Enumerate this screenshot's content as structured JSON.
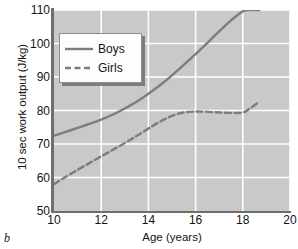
{
  "figure": {
    "panel_label": "b"
  },
  "legend": {
    "position": "top-left-inside",
    "entries": [
      {
        "label": "Boys",
        "style": "solid"
      },
      {
        "label": "Girls",
        "style": "dashed"
      }
    ]
  },
  "colors": {
    "plot_background": "#c9c9c9",
    "gridline": "#ffffff",
    "series_line": "#7d7d7d",
    "axis": "#6e6e6e",
    "text": "#141414",
    "legend_background": "#fdfdfd"
  },
  "chart_data": {
    "type": "line",
    "title": "",
    "xlabel": "Age (years)",
    "ylabel": "10 sec work output (J/kg)",
    "xlim": [
      10,
      20
    ],
    "ylim": [
      50,
      110
    ],
    "xticks": [
      10,
      12,
      14,
      16,
      18,
      20
    ],
    "yticks": [
      50,
      60,
      70,
      80,
      90,
      100,
      110
    ],
    "xtick_labels": [
      "10",
      "12",
      "14",
      "16",
      "18",
      "20"
    ],
    "ytick_labels": [
      "50",
      "60",
      "70",
      "80",
      "90",
      "100",
      "110"
    ],
    "grid": true,
    "legend_entries": [
      "Boys",
      "Girls"
    ],
    "series": [
      {
        "name": "Boys",
        "style": "solid",
        "x": [
          10.0,
          10.5,
          11.0,
          11.5,
          12.0,
          12.5,
          13.0,
          13.5,
          14.0,
          14.5,
          15.0,
          15.5,
          16.0,
          16.5,
          17.0,
          17.5,
          18.0,
          18.3,
          18.7
        ],
        "values": [
          72.5,
          73.6,
          74.8,
          76.0,
          77.3,
          78.8,
          80.6,
          82.6,
          85.0,
          87.6,
          90.5,
          93.6,
          96.8,
          100.2,
          103.6,
          106.9,
          109.6,
          110.0,
          110.0
        ]
      },
      {
        "name": "Girls",
        "style": "dashed",
        "x": [
          10.0,
          10.5,
          11.0,
          11.5,
          12.0,
          12.5,
          13.0,
          13.5,
          14.0,
          14.5,
          15.0,
          15.5,
          16.0,
          16.5,
          17.0,
          17.5,
          18.0,
          18.3,
          18.7
        ],
        "values": [
          58.0,
          60.2,
          62.3,
          64.3,
          66.3,
          68.3,
          70.3,
          72.4,
          74.6,
          76.7,
          78.4,
          79.4,
          79.7,
          79.6,
          79.4,
          79.3,
          79.4,
          80.6,
          82.6
        ]
      }
    ]
  }
}
